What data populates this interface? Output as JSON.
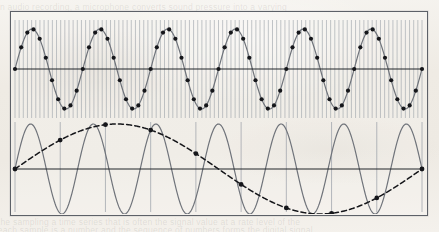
{
  "figure": {
    "title": "Aliasing of a sampled sinusoid",
    "border_color": "#5d6168",
    "paper_color": "#f1ede7",
    "wave_color": "#6f737a",
    "dot_color": "#15161a",
    "grid_color": "#9aa0a8",
    "axis_color": "#23262b"
  },
  "ghost_text": {
    "line1": "in audio recording, a microphone converts sound pressure into a varying",
    "line2": "the sampling a time series that is often the signal value at a rate level of the",
    "line3": "each sample is a number and the sequence of numbers forms the digital signal"
  },
  "chart_data": [
    {
      "type": "line",
      "title": "Adequately sampled sinusoid",
      "panel": "top",
      "xlabel": "",
      "ylabel": "",
      "xlim": [
        0,
        6
      ],
      "ylim": [
        -1.15,
        1.15
      ],
      "grid": true,
      "grid_lines": 98,
      "legend": "none",
      "series": [
        {
          "name": "signal",
          "style": "solid",
          "color": "#6f737a",
          "cycles": 6,
          "amplitude": 1.0,
          "phase": 0
        },
        {
          "name": "samples",
          "style": "markers",
          "color": "#15161a",
          "marker": "filled-circle",
          "samples_per_cycle": 11,
          "count": 66,
          "values": [
            0,
            0.54,
            0.91,
            0.99,
            0.76,
            0.28,
            -0.28,
            -0.76,
            -0.99,
            -0.91,
            -0.54
          ]
        }
      ],
      "axis": {
        "zero_line": true
      }
    },
    {
      "type": "line",
      "title": "Undersampled sinusoid producing an alias",
      "panel": "bottom",
      "xlabel": "",
      "ylabel": "",
      "xlim": [
        0,
        6.5
      ],
      "ylim": [
        -1.15,
        1.15
      ],
      "grid": true,
      "grid_lines": 9,
      "legend": "none",
      "series": [
        {
          "name": "original-high-frequency-signal",
          "style": "solid",
          "color": "#6f737a",
          "cycles": 6.5,
          "amplitude": 1.0,
          "phase": 0
        },
        {
          "name": "aliased-reconstruction",
          "style": "dashed",
          "color": "#15161a",
          "cycles": 1.0,
          "amplitude": 1.0,
          "phase": 0
        },
        {
          "name": "samples",
          "style": "markers",
          "color": "#15161a",
          "marker": "filled-circle",
          "count": 9,
          "values": [
            0,
            -0.87,
            -0.87,
            0,
            0.87,
            0.87,
            0,
            -0.87,
            -0.87
          ]
        }
      ],
      "axis": {
        "zero_line": true
      }
    }
  ]
}
